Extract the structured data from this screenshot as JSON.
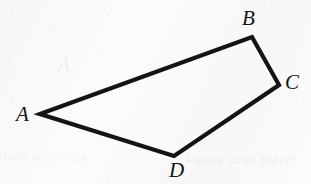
{
  "figure": {
    "name": "quadrilateral-abcd",
    "background_color": "#fbfbfb",
    "stroke_color": "#141414",
    "label_color": "#141414",
    "stroke_width": 4.2,
    "canvas": {
      "width": 311,
      "height": 184
    },
    "vertices": [
      {
        "id": "A",
        "label": "A",
        "x": 40,
        "y": 114,
        "label_x": 16,
        "label_y": 104
      },
      {
        "id": "B",
        "label": "B",
        "x": 252,
        "y": 37,
        "label_x": 242,
        "label_y": 8
      },
      {
        "id": "C",
        "label": "C",
        "x": 279,
        "y": 85,
        "label_x": 285,
        "label_y": 72
      },
      {
        "id": "D",
        "label": "D",
        "x": 174,
        "y": 156,
        "label_x": 169,
        "label_y": 160
      }
    ],
    "edges": [
      {
        "id": "AB",
        "from": "A",
        "to": "B"
      },
      {
        "id": "BC",
        "from": "B",
        "to": "C"
      },
      {
        "id": "CD",
        "from": "C",
        "to": "D"
      },
      {
        "id": "DA",
        "from": "D",
        "to": "A"
      }
    ],
    "path": "M 40 114 L 252 37 L 279 85 L 174 156 Z",
    "artifacts": {
      "ghost_text_bottom_right": "Figure scan bleed",
      "ghost_text_bottom_left": "faint print show-through",
      "ghost_letter_middle": "A"
    }
  }
}
